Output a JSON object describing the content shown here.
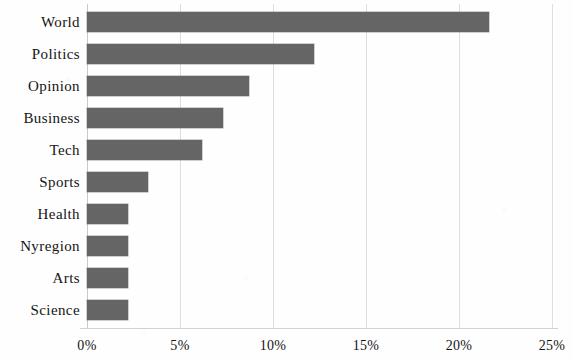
{
  "chart_data": {
    "type": "bar",
    "orientation": "horizontal",
    "title": "",
    "subtitle": "",
    "xlabel": "",
    "ylabel": "",
    "categories": [
      "World",
      "Politics",
      "Opinion",
      "Business",
      "Tech",
      "Sports",
      "Health",
      "Nyregion",
      "Arts",
      "Science"
    ],
    "values": [
      21.6,
      12.2,
      8.7,
      7.3,
      6.2,
      3.3,
      2.2,
      2.2,
      2.2,
      2.2
    ],
    "value_unit": "%",
    "xlim": [
      0,
      25
    ],
    "xticks": [
      0,
      5,
      10,
      15,
      20,
      25
    ],
    "xtick_labels": [
      "0%",
      "5%",
      "10%",
      "15%",
      "20%",
      "25%"
    ],
    "grid": "vertical",
    "legend": "none",
    "bar_color": "#656565",
    "gridline_color": "#dedede",
    "axis_color": "#d2d2d2",
    "text_color": "#141414",
    "background_color": "#fefefe"
  }
}
